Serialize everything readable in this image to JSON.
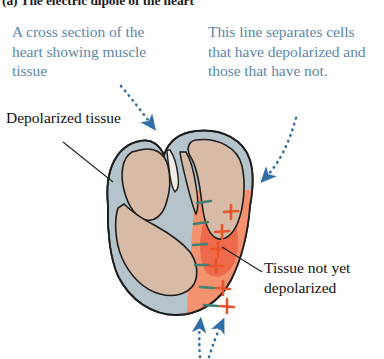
{
  "figure": {
    "title_label": "(a)",
    "title_text": "The electric dipole of the heart",
    "width": 384,
    "height": 359
  },
  "callouts": {
    "left": {
      "text": "A cross section of the heart showing muscle tissue",
      "color": "#5b87ab"
    },
    "right": {
      "text": "This line separates cells that have depolarized and those that have not.",
      "color": "#5b87ab"
    }
  },
  "labels": {
    "depolarized": {
      "text": "Depolarized tissue",
      "color": "#111111"
    },
    "not_depolarized": {
      "text": "Tissue not yet depolarized",
      "color": "#111111"
    }
  },
  "diagram": {
    "name": "heart-cross-section",
    "colors": {
      "muscle_tissue": "#d7bba6",
      "outer_wall": "#b5c3cb",
      "depolarizing_region": "#f28a6a",
      "depolarizing_core": "#ef6a4a",
      "outline": "#1d1d1d",
      "plus_sign": "#e8552c",
      "minus_sign": "#3f7f74",
      "arrow_blue": "#2f6ea8"
    },
    "charge_pairs": [
      {
        "minus_x": 203,
        "minus_y": 202,
        "plus_x": 230,
        "plus_y": 213
      },
      {
        "minus_x": 200,
        "minus_y": 223,
        "plus_x": 222,
        "plus_y": 233
      },
      {
        "minus_x": 199,
        "minus_y": 243,
        "plus_x": 218,
        "plus_y": 249
      },
      {
        "minus_x": 201,
        "minus_y": 262,
        "plus_x": 215,
        "plus_y": 265
      },
      {
        "minus_x": 205,
        "minus_y": 285,
        "plus_x": 223,
        "plus_y": 285
      },
      {
        "minus_x": 209,
        "minus_y": 303,
        "plus_x": 227,
        "plus_y": 303
      }
    ],
    "bottom_arrows": 2
  }
}
